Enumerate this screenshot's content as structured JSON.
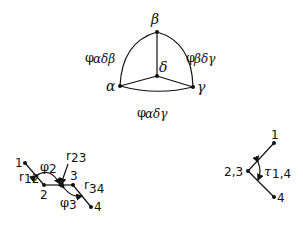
{
  "top_diagram": {
    "vertices": {
      "beta": {
        "label": "β",
        "x": 157,
        "y": 32
      },
      "delta": {
        "label": "δ",
        "x": 157,
        "y": 76
      },
      "alpha": {
        "label": "α",
        "x": 120,
        "y": 86
      },
      "gamma": {
        "label": "γ",
        "x": 193,
        "y": 87
      }
    },
    "edge_labels": {
      "left": {
        "phi": "φ",
        "sub": "αδβ"
      },
      "right": {
        "phi": "φ",
        "sub": "βδγ"
      },
      "bottom": {
        "phi": "φ",
        "sub": "αδγ"
      }
    }
  },
  "chain_diagram": {
    "atoms": {
      "a1": {
        "label": "1"
      },
      "a2": {
        "label": "2"
      },
      "a3": {
        "label": "3"
      },
      "a4": {
        "label": "4"
      }
    },
    "bond_labels": {
      "r12": {
        "r": "r",
        "sub": "12"
      },
      "r23": {
        "r": "r",
        "sub": "23"
      },
      "r34": {
        "r": "r",
        "sub": "34"
      }
    },
    "angle_labels": {
      "phi2": {
        "phi": "φ",
        "sub": "2"
      },
      "phi3": {
        "phi": "φ",
        "sub": "3"
      }
    }
  },
  "torsion_diagram": {
    "atoms": {
      "a1": {
        "label": "1"
      },
      "a23": {
        "label": "2,3"
      },
      "a4": {
        "label": "4"
      }
    },
    "torsion_label": {
      "tau": "τ",
      "sub": "1,4"
    }
  }
}
